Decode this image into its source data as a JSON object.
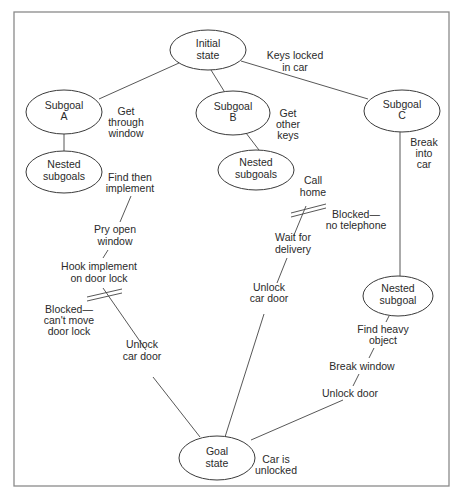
{
  "diagram": {
    "type": "problem-solving goal tree",
    "nodes": {
      "initial": {
        "line1": "Initial",
        "line2": "state"
      },
      "subgoal_a": {
        "line1": "Subgoal",
        "line2": "A"
      },
      "subgoal_b": {
        "line1": "Subgoal",
        "line2": "B"
      },
      "subgoal_c": {
        "line1": "Subgoal",
        "line2": "C"
      },
      "nested_a": {
        "line1": "Nested",
        "line2": "subgoals"
      },
      "nested_b": {
        "line1": "Nested",
        "line2": "subgoals"
      },
      "nested_c": {
        "line1": "Nested",
        "line2": "subgoal"
      },
      "goal": {
        "line1": "Goal",
        "line2": "state"
      }
    },
    "labels": {
      "keys_locked": {
        "line1": "Keys locked",
        "line2": "in car"
      },
      "get_through_window": {
        "line1": "Get",
        "line2": "through",
        "line3": "window"
      },
      "get_other_keys": {
        "line1": "Get",
        "line2": "other",
        "line3": "keys"
      },
      "break_into_car": {
        "line1": "Break",
        "line2": "into",
        "line3": "car"
      },
      "find_implement": {
        "line1": "Find then",
        "line2": "implement"
      },
      "pry_open_window": {
        "line1": "Pry open",
        "line2": "window"
      },
      "hook_implement": {
        "line1": "Hook implement",
        "line2": "on door lock"
      },
      "blocked_door_lock": {
        "line1": "Blocked—",
        "line2": "can't move",
        "line3": "door lock"
      },
      "unlock_car_door_a": {
        "line1": "Unlock",
        "line2": "car door"
      },
      "call_home": {
        "line1": "Call",
        "line2": "home"
      },
      "blocked_telephone": {
        "line1": "Blocked—",
        "line2": "no telephone"
      },
      "wait_for_delivery": {
        "line1": "Wait for",
        "line2": "delivery"
      },
      "unlock_car_door_b": {
        "line1": "Unlock",
        "line2": "car door"
      },
      "find_heavy_object": {
        "line1": "Find heavy",
        "line2": "object"
      },
      "break_window": {
        "line1": "Break window"
      },
      "unlock_door": {
        "line1": "Unlock door"
      },
      "car_is_unlocked": {
        "line1": "Car is",
        "line2": "unlocked"
      }
    }
  }
}
